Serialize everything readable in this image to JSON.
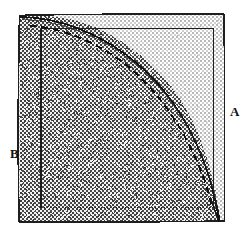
{
  "figure": {
    "kind": "geometry-diagram",
    "background_color": "#ffffff",
    "labels": [
      {
        "id": "A",
        "text": "A",
        "region": "light-gray-region-outside-arc",
        "x": 232,
        "y": 112
      },
      {
        "id": "B",
        "text": "B",
        "region": "dark-gray-region-inside-arc",
        "x": 13,
        "y": 154
      }
    ],
    "regions": [
      {
        "name": "light-region-A",
        "fill_color": "#d9d9d9",
        "dither": "light-checkerboard",
        "description": "outer square area outside the quarter-circle arc"
      },
      {
        "name": "dark-region-B",
        "fill_color": "#808080",
        "dither": "50-percent-checkerboard",
        "description": "area inside the quarter-circle arc, lower-left of the arc"
      }
    ],
    "shapes": [
      {
        "name": "outer-square",
        "type": "square",
        "stroke_color": "#1a1a1a",
        "style": "hand-drawn",
        "x": 18,
        "y": 14,
        "width": 207,
        "height": 208
      },
      {
        "name": "inner-square",
        "type": "square",
        "stroke_color": "#1a1a1a",
        "style": "thin-solid",
        "x": 40,
        "y": 28,
        "width": 174,
        "height": 180
      },
      {
        "name": "arc-solid",
        "type": "quarter-circle-arc",
        "stroke_color": "#1a1a1a",
        "style": "solid",
        "center_x": 22,
        "center_y": 18,
        "radius": 198
      },
      {
        "name": "arc-dashed",
        "type": "quarter-circle-arc",
        "stroke_color": "#1a1a1a",
        "style": "dashed",
        "center_x": 30,
        "center_y": 24,
        "radius": 186
      },
      {
        "name": "inner-square-bottom-dotted",
        "type": "line",
        "stroke_color": "#1a1a1a",
        "style": "dotted"
      }
    ],
    "colors": {
      "stroke": "#1a1a1a",
      "light_fill": "#d9d9d9",
      "dark_fill": "#808080",
      "background": "#ffffff"
    }
  }
}
